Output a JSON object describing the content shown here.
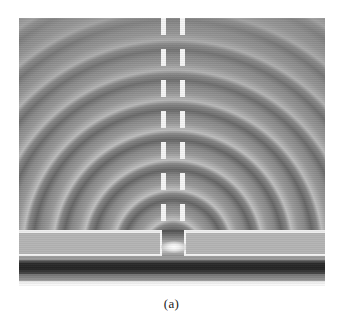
{
  "figure": {
    "caption": "(a)",
    "alt_description": "Simulated electromagnetic field amplitude: circular wavefronts radiating from a sub-wavelength slit aperture in a metal film over a layered substrate",
    "frame": {
      "x": 19,
      "y": 18,
      "width": 306,
      "height": 268
    }
  },
  "colors": {
    "background_medium": "#8e8e8e",
    "wavefront_bright": "#ffffff",
    "wavefront_dark": "#2b2b2b",
    "guide_wall": "#f4f4f4",
    "film": "#b4b4b4",
    "absorbing_layer": "#232323",
    "bright_layer": "#fbfbfb",
    "caption_text": "#1b1b1b",
    "page": "#ffffff"
  },
  "chart_data": {
    "type": "heatmap",
    "title": "(a)",
    "xlabel": "",
    "ylabel": "",
    "colormap": "grayscale",
    "grid": false,
    "legend": "none",
    "annotations": [
      {
        "name": "point-source",
        "x": 173,
        "y": 248,
        "label": "slit aperture source"
      },
      {
        "name": "guide-wall-left",
        "x": 161,
        "label": "dashed waveguide wall (left)"
      },
      {
        "name": "guide-wall-right",
        "x": 180,
        "label": "dashed waveguide wall (right)"
      }
    ],
    "wave_pattern": {
      "geometry": "concentric circular arcs",
      "source_x": 173,
      "source_y": 250,
      "fringe_period_px": 30,
      "visible_fringe_count": 8,
      "arc_radii_px": [
        16,
        46,
        76,
        106,
        136,
        166,
        196,
        226
      ]
    },
    "layers": [
      {
        "name": "metal-film-top-edge",
        "top": 212,
        "height": 3,
        "value": "#ededed"
      },
      {
        "name": "metal-film",
        "top": 215,
        "height": 22,
        "value": "#b4b4b4"
      },
      {
        "name": "film-bottom-edge",
        "top": 236,
        "height": 2,
        "value": "#f2f2f2"
      },
      {
        "name": "spacer-gap",
        "top": 238,
        "height": 4,
        "value": "#9a9a9a"
      },
      {
        "name": "absorbing-layer",
        "top": 242,
        "height": 14,
        "value": "#232323"
      },
      {
        "name": "transition-layer",
        "top": 256,
        "height": 7,
        "value": "#9c9c9c"
      },
      {
        "name": "bright-layer",
        "top": 263,
        "height": 9,
        "value": "#fbfbfb"
      },
      {
        "name": "lower-substrate",
        "top": 272,
        "height": 10,
        "value": "#8d8d8d"
      },
      {
        "name": "base-layer",
        "top": 282,
        "height": 6,
        "value": "#6e6e6e"
      }
    ],
    "aperture": {
      "left_px": 162,
      "right_px": 184,
      "width_px": 22,
      "top_px": 230,
      "height_px": 26
    }
  }
}
